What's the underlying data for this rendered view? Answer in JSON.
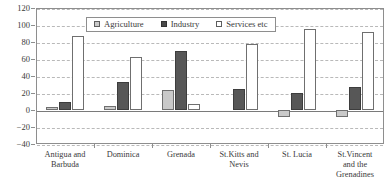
{
  "chart_data": {
    "type": "bar",
    "title": "",
    "subtitle": "",
    "xlabel": "",
    "ylabel": "",
    "ylim": [
      -40,
      120
    ],
    "yticks": [
      120,
      100,
      80,
      60,
      40,
      20,
      0,
      -20,
      -40
    ],
    "ytick_labels": [
      "120",
      "100",
      "80",
      "60",
      "40",
      "20",
      "0",
      "−20",
      "−40"
    ],
    "grid": true,
    "legend_position": "top-center",
    "categories": [
      "Antigua and Barbuda",
      "Dominica",
      "Grenada",
      "St.Kitts and Nevis",
      "St. Lucia",
      "St.Vincent and the Grenadines"
    ],
    "category_lines": [
      [
        "Antigua and",
        "Barbuda"
      ],
      [
        "Dominica"
      ],
      [
        "Grenada"
      ],
      [
        "St.Kitts and",
        "Nevis"
      ],
      [
        "St. Lucia"
      ],
      [
        "St.Vincent",
        "and the",
        "Grenadines"
      ]
    ],
    "series": [
      {
        "name": "Agriculture",
        "color": "#c9c9c9",
        "values": [
          3,
          5,
          23,
          0,
          -8,
          -8
        ]
      },
      {
        "name": "Industry",
        "color": "#575757",
        "values": [
          10,
          33,
          70,
          25,
          20,
          27
        ]
      },
      {
        "name": "Services etc",
        "color": "#ffffff",
        "values": [
          87,
          62,
          7,
          78,
          95,
          92
        ]
      }
    ]
  },
  "legend": {
    "items": [
      {
        "label": "Agriculture",
        "swatch": "agriculture"
      },
      {
        "label": "Industry",
        "swatch": "industry"
      },
      {
        "label": "Services etc",
        "swatch": "services"
      }
    ]
  },
  "colors": {
    "agriculture": "#c9c9c9",
    "industry": "#575757",
    "services": "#ffffff",
    "axis": "#8e8e8e",
    "grid": "#b9b9b9",
    "text": "#3a3a3a"
  }
}
